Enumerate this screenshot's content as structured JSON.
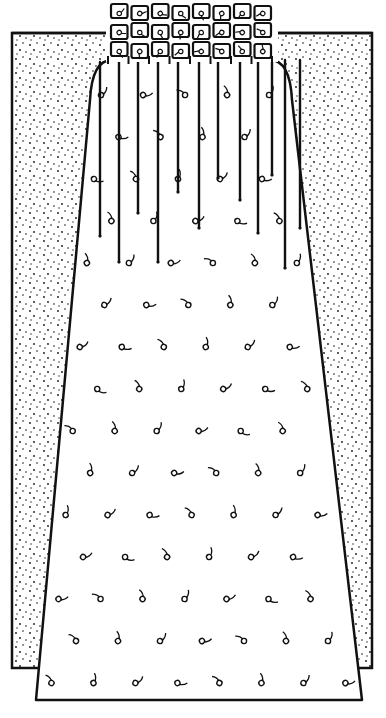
{
  "figure": {
    "type": "line-illustration",
    "colors": {
      "ink": "#111111",
      "paper": "#ffffff"
    },
    "background_panel": {
      "x": 12,
      "y": 33,
      "w": 360,
      "h": 635
    },
    "skirt": {
      "top_y": 60,
      "top_left_x": 90,
      "top_right_x": 292,
      "bottom_y": 700,
      "bottom_left_x": 36,
      "bottom_right_x": 362
    },
    "waistband_grid": {
      "x": 110,
      "y": 3,
      "cols": 8,
      "rows": 3,
      "cell_w": 20.5,
      "cell_h": 19
    },
    "gather_lines": [
      {
        "x": 100,
        "y1": 62,
        "y2": 236
      },
      {
        "x": 119,
        "y1": 60,
        "y2": 262
      },
      {
        "x": 138,
        "y1": 60,
        "y2": 213
      },
      {
        "x": 158,
        "y1": 60,
        "y2": 262
      },
      {
        "x": 178,
        "y1": 60,
        "y2": 192
      },
      {
        "x": 199,
        "y1": 60,
        "y2": 228
      },
      {
        "x": 218,
        "y1": 60,
        "y2": 178
      },
      {
        "x": 240,
        "y1": 60,
        "y2": 200
      },
      {
        "x": 258,
        "y1": 60,
        "y2": 233
      },
      {
        "x": 272,
        "y1": 60,
        "y2": 175
      },
      {
        "x": 285,
        "y1": 60,
        "y2": 268
      },
      {
        "x": 300,
        "y1": 60,
        "y2": 228
      }
    ]
  }
}
